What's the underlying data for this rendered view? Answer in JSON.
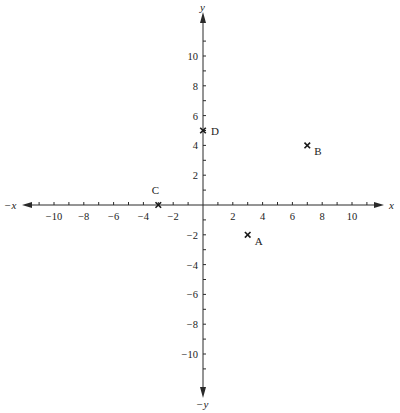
{
  "chart_data": {
    "type": "scatter",
    "title": "",
    "xlabel": "x",
    "ylabel": "y",
    "xlabel_negative": "−x",
    "ylabel_negative": "−y",
    "xlim": [
      -12,
      12
    ],
    "ylim": [
      -12,
      12
    ],
    "grid": false,
    "legend": null,
    "x_ticks": [
      -10,
      -8,
      -6,
      -4,
      -2,
      2,
      4,
      6,
      8,
      10
    ],
    "x_tick_labels": [
      "−10",
      "−8",
      "−6",
      "−4",
      "−2",
      "2",
      "4",
      "6",
      "8",
      "10"
    ],
    "y_ticks": [
      -10,
      -8,
      -6,
      -4,
      -2,
      2,
      4,
      6,
      8,
      10
    ],
    "y_tick_labels": [
      "−10",
      "−8",
      "−6",
      "−4",
      "−2",
      "2",
      "4",
      "6",
      "8",
      "10"
    ],
    "minor_tick_step": 1,
    "points": [
      {
        "label": "A",
        "x": 3,
        "y": -2
      },
      {
        "label": "B",
        "x": 7,
        "y": 4
      },
      {
        "label": "C",
        "x": -3,
        "y": 0
      },
      {
        "label": "D",
        "x": 0,
        "y": 5
      }
    ],
    "marker": "x",
    "colors": {
      "axis": "#2a2a2a",
      "marker": "#1a1a1a",
      "text": "#222222"
    }
  }
}
